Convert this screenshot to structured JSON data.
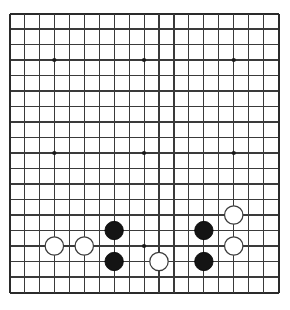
{
  "board": {
    "game": "Go",
    "size": 19,
    "size_label": "19x19",
    "grid": {
      "origin_x": 9.5,
      "origin_y": 13.5,
      "spacing_x": 14.95,
      "spacing_y": 15.5,
      "line_color": "#3a3a3a",
      "border_color": "#2a2a2a",
      "background_color": "#ffffff",
      "line_width": 1.1,
      "border_width": 2.0
    },
    "star_points": [
      {
        "col": 3,
        "row": 3
      },
      {
        "col": 9,
        "row": 3
      },
      {
        "col": 15,
        "row": 3
      },
      {
        "col": 3,
        "row": 9
      },
      {
        "col": 9,
        "row": 9
      },
      {
        "col": 15,
        "row": 9
      },
      {
        "col": 3,
        "row": 15
      },
      {
        "col": 9,
        "row": 15
      },
      {
        "col": 15,
        "row": 15
      }
    ],
    "star_point_radius": 2.1,
    "star_point_color": "#1a1a1a",
    "stone_radius": 9.2,
    "stone_colors": {
      "black_fill": "#141414",
      "black_stroke": "#000000",
      "white_fill": "#ffffff",
      "white_stroke": "#3a3a3a"
    },
    "stones": [
      {
        "color": "white",
        "col": 3,
        "row": 15,
        "label": "white-stone-d4"
      },
      {
        "color": "white",
        "col": 5,
        "row": 15,
        "label": "white-stone-f4"
      },
      {
        "color": "black",
        "col": 7,
        "row": 14,
        "label": "black-stone-h5"
      },
      {
        "color": "black",
        "col": 7,
        "row": 16,
        "label": "black-stone-h3"
      },
      {
        "color": "white",
        "col": 10,
        "row": 16,
        "label": "white-stone-l3"
      },
      {
        "color": "black",
        "col": 13,
        "row": 14,
        "label": "black-stone-o5"
      },
      {
        "color": "black",
        "col": 13,
        "row": 16,
        "label": "black-stone-o3"
      },
      {
        "color": "white",
        "col": 15,
        "row": 13,
        "label": "white-stone-q6"
      },
      {
        "color": "white",
        "col": 15,
        "row": 15,
        "label": "white-stone-q4"
      }
    ],
    "counts": {
      "black_stones": 4,
      "white_stones": 5,
      "total_stones": 9
    }
  }
}
